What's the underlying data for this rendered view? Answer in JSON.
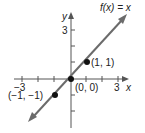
{
  "graph": {
    "function_label": "f(x) = x",
    "x_axis_label": "x",
    "y_axis_label": "y",
    "x_ticks": {
      "min_label": "−3",
      "max_label": "3"
    },
    "y_ticks": {
      "max_label": "3"
    },
    "points": [
      {
        "label": "(−1, −1)",
        "x": -1,
        "y": -1
      },
      {
        "label": "(0, 0)",
        "x": 0,
        "y": 0
      },
      {
        "label": "(1, 1)",
        "x": 1,
        "y": 1
      }
    ],
    "line_color": "#6b6b6b",
    "axis_color": "#555555"
  }
}
